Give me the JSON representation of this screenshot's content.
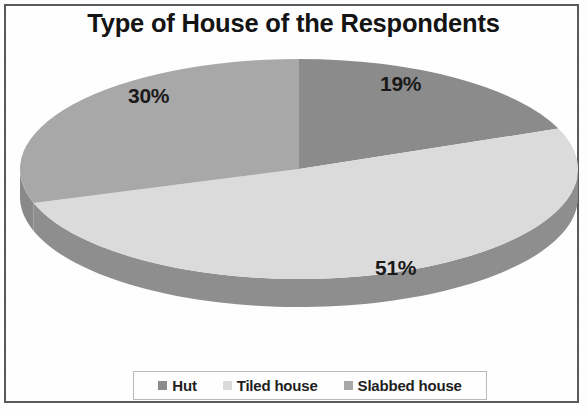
{
  "chart_data": {
    "type": "pie",
    "title": "Type of House of the Respondents",
    "xlabel": "",
    "ylabel": "",
    "legend_position": "bottom",
    "grid": false,
    "units": "percent",
    "categories": [
      "Hut",
      "Tiled house",
      "Slabbed house"
    ],
    "values": [
      19,
      51,
      30
    ],
    "data_labels": [
      "19%",
      "51%",
      "30%"
    ],
    "colors": [
      "#8c8c8c",
      "#dcdcdc",
      "#a9a9a9"
    ],
    "slices": [
      {
        "label": "Hut",
        "value": 19,
        "data_label": "19%",
        "color": "#8c8c8c",
        "side_color": "#6f6f6f"
      },
      {
        "label": "Tiled house",
        "value": 51,
        "data_label": "51%",
        "color": "#dcdcdc",
        "side_color": "#8f8f8f"
      },
      {
        "label": "Slabbed house",
        "value": 30,
        "data_label": "30%",
        "color": "#a9a9a9",
        "side_color": "#8a8a8a"
      }
    ]
  },
  "chart": {
    "title": "Type of House of the Respondents",
    "labels": {
      "hut": "19%",
      "tiled": "51%",
      "slabbed": "30%"
    }
  },
  "legend": {
    "items": [
      {
        "label": "Hut",
        "color": "#8c8c8c"
      },
      {
        "label": "Tiled house",
        "color": "#dcdcdc"
      },
      {
        "label": "Slabbed house",
        "color": "#a9a9a9"
      }
    ]
  }
}
